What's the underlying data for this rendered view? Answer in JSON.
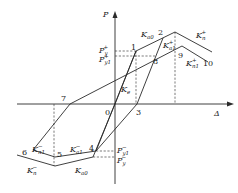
{
  "diagram": {
    "type": "hysteresis-model",
    "axes": {
      "vertical": "P",
      "horizontal": "Δ"
    },
    "points": [
      "0",
      "1",
      "2",
      "3",
      "4",
      "5",
      "6",
      "7",
      "8",
      "9",
      "10"
    ],
    "labels": {
      "axis_p": "P",
      "axis_delta": "Δ",
      "pt0": "0",
      "pt1": "1",
      "pt2": "2",
      "pt3": "3",
      "pt4": "4",
      "pt5": "5",
      "pt6": "6",
      "pt7": "7",
      "pt8": "8",
      "pt9": "9",
      "pt10": "10",
      "py_plus": "P",
      "py_plus_sub": "y",
      "py_plus_sup": "+",
      "py1_plus": "P",
      "py1_plus_sub": "y1",
      "py1_plus_sup": "+",
      "py1_minus": "P",
      "py1_minus_sub": "y1",
      "py1_minus_sup": "−",
      "py_minus": "P",
      "py_minus_sub": "y",
      "py_minus_sup": "−",
      "ke": "K",
      "ke_sub": "e",
      "ka0_top": "K",
      "ka0_top_sub": "a0",
      "ka1_plus": "K",
      "ka1_plus_sub": "a1",
      "ka1_plus_sup": "+",
      "kn_plus": "K",
      "kn_plus_sub": "n",
      "kn_plus_sup": "+",
      "kn1_plus": "K",
      "kn1_plus_sub": "n1",
      "kn1_plus_sup": "+",
      "kn1_minus": "K",
      "kn1_minus_sub": "n1",
      "kn1_minus_sup": "−",
      "ka1_minus": "K",
      "ka1_minus_sub": "a1",
      "ka1_minus_sup": "−",
      "kn_minus": "K",
      "kn_minus_sub": "n",
      "kn_minus_sup": "−",
      "ka0_bottom": "K",
      "ka0_bottom_sub": "a0"
    }
  }
}
